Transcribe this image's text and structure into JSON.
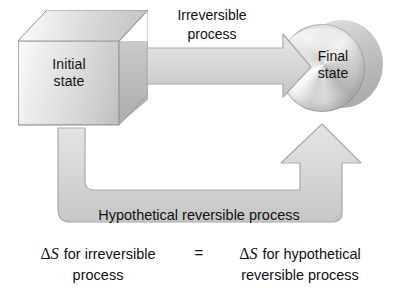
{
  "diagram": {
    "title_semantic": "entropy-irreversible-vs-reversible-process",
    "initial_state": {
      "label_line1": "Initial",
      "label_line2": "state",
      "shape": "cube"
    },
    "final_state": {
      "label_line1": "Final",
      "label_line2": "state",
      "shape": "disc"
    },
    "top_arrow": {
      "label_line1": "Irreversible",
      "label_line2": "process",
      "direction": "right"
    },
    "bottom_arrow": {
      "label": "Hypothetical reversible process",
      "direction": "u-turn-up"
    },
    "equation": {
      "left_delta": "Δ",
      "left_var": "S",
      "left_line1": "for irreversible",
      "left_line2": "process",
      "operator": "=",
      "right_delta": "Δ",
      "right_var": "S",
      "right_line1": "for hypothetical",
      "right_line2": "reversible process"
    },
    "colors": {
      "arrow_fill": "#d6d6d6",
      "arrow_stroke": "#a8a8a8",
      "text": "#111111",
      "background": "#ffffff"
    }
  }
}
